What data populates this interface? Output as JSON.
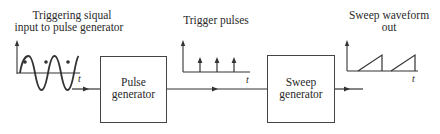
{
  "diagram": {
    "input_signal": {
      "title_line1": "Triggering siqual",
      "title_line2": "input to pulse generator",
      "axis_label": "t"
    },
    "pulse_generator": {
      "label_line1": "Pulse",
      "label_line2": "generator"
    },
    "trigger_pulses": {
      "title": "Trigger pulses",
      "axis_label": "t",
      "pulse_count": 3
    },
    "sweep_generator": {
      "label_line1": "Sweep",
      "label_line2": "generator"
    },
    "sweep_output": {
      "title_line1": "Sweep waveform",
      "title_line2": "out",
      "axis_label": "t",
      "ramp_count": 2
    },
    "colors": {
      "line": "#333333",
      "text": "#2a2a2a",
      "background": "#ffffff"
    }
  }
}
